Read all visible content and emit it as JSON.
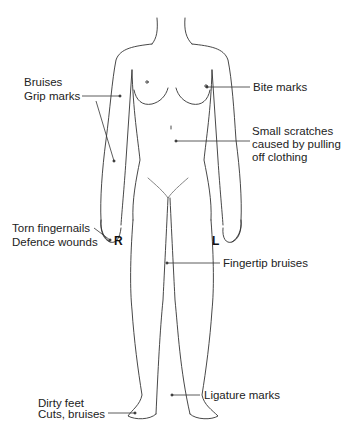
{
  "figure": {
    "side_markers": {
      "right": "R",
      "left": "L"
    }
  },
  "labels": {
    "bruises": "Bruises",
    "grip_marks": "Grip marks",
    "bite_marks": "Bite marks",
    "small_scratches_1": "Small scratches",
    "small_scratches_2": "caused by pulling",
    "small_scratches_3": "off clothing",
    "torn_fingernails": "Torn fingernails",
    "defence_wounds": "Defence wounds",
    "fingertip_bruises": "Fingertip bruises",
    "ligature_marks": "Ligature marks",
    "dirty_feet": "Dirty feet",
    "cuts_bruises": "Cuts, bruises"
  }
}
